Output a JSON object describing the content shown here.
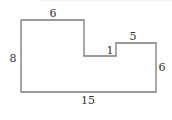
{
  "figure": {
    "type": "composite rectilinear shape",
    "labels": {
      "top_left_width": "6",
      "left_height": "8",
      "notch_step": "1",
      "right_top_width": "5",
      "right_height": "6",
      "bottom_width": "15"
    },
    "stroke_color": "#7a7a7a",
    "text_color": "#333333"
  }
}
